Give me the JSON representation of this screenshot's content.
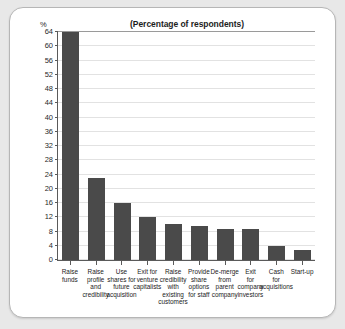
{
  "chart_data": {
    "type": "bar",
    "title": "(Percentage of respondents)",
    "xlabel": "",
    "ylabel": "%",
    "ylim": [
      0,
      64
    ],
    "yticks": [
      0,
      4,
      8,
      12,
      16,
      20,
      24,
      28,
      32,
      36,
      40,
      44,
      48,
      52,
      56,
      60,
      64
    ],
    "grid": true,
    "legend": null,
    "bar_color": "#4a4a4a",
    "categories": [
      "Raise funds",
      "Raise profile and credibility",
      "Use shares for future acquisition",
      "Exit for venture capitalists",
      "Raise credibility with existing customers",
      "Provide share options for staff",
      "De-merge from parent company",
      "Exit for company investors",
      "Cash for acquisitions",
      "Start-up"
    ],
    "category_lines": [
      [
        "Raise",
        "funds"
      ],
      [
        "Raise",
        "profile",
        "and",
        "credibility"
      ],
      [
        "Use",
        "shares for",
        "future",
        "acquisition"
      ],
      [
        "Exit for",
        "venture",
        "capitalists"
      ],
      [
        "Raise",
        "credibility",
        "with",
        "existing",
        "customers"
      ],
      [
        "Provide",
        "share",
        "options",
        "for staff"
      ],
      [
        "De-merge",
        "from",
        "parent",
        "company"
      ],
      [
        "Exit",
        "for",
        "company",
        "investors"
      ],
      [
        "Cash",
        "for",
        "acquisitions"
      ],
      [
        "Start-up"
      ]
    ],
    "values": [
      64,
      23,
      16,
      12,
      10,
      9.5,
      8.7,
      8.7,
      4,
      2.7
    ]
  }
}
